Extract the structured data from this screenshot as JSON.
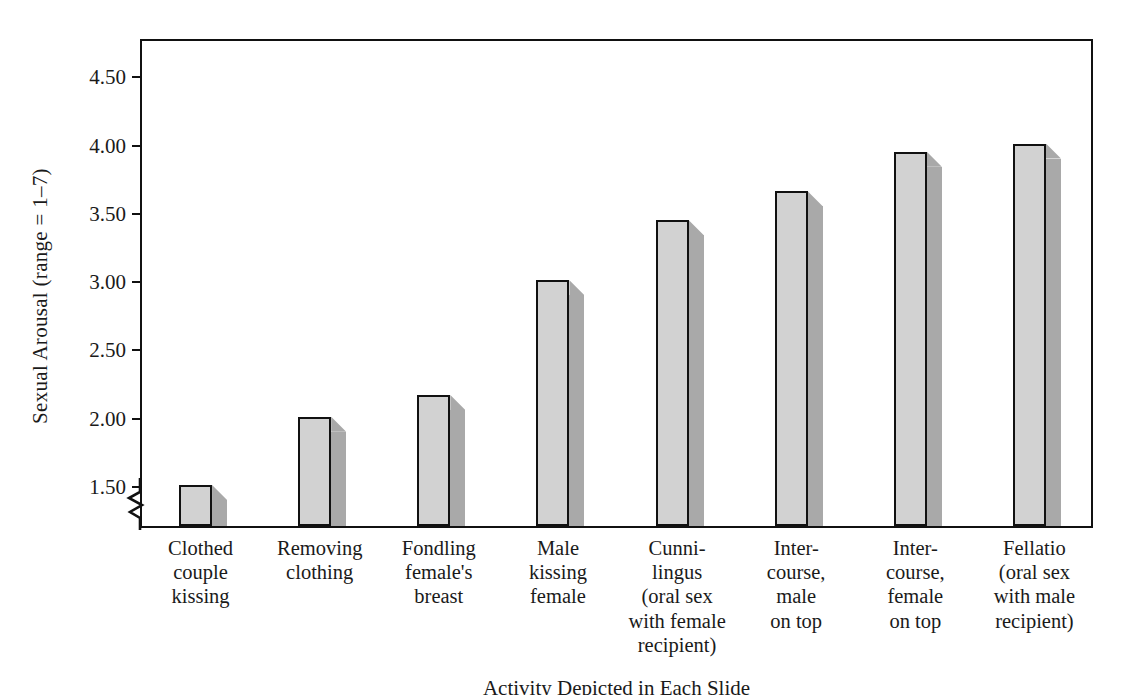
{
  "chart_data": {
    "type": "bar",
    "title": "",
    "subtitle": "",
    "xlabel": "Activity Depicted in Each Slide",
    "ylabel": "Sexual Arousal (range = 1–7)",
    "ylim": [
      1.2,
      4.78
    ],
    "yticks": [
      1.5,
      2.0,
      2.5,
      3.0,
      3.5,
      4.0,
      4.5
    ],
    "ytick_labels": [
      "1.50",
      "2.00",
      "2.50",
      "3.00",
      "3.50",
      "4.00",
      "4.50"
    ],
    "axis_break": true,
    "grid": false,
    "legend": null,
    "legend_position": "none",
    "categories": [
      "Clothed\ncouple\nkissing",
      "Removing\nclothing",
      "Fondling\nfemale's\nbreast",
      "Male\nkissing\nfemale",
      "Cunni-\nlingus\n(oral sex\nwith female\nrecipient)",
      "Inter-\ncourse,\nmale\non top",
      "Inter-\ncourse,\nfemale\non top",
      "Fellatio\n(oral sex\nwith male\nrecipient)"
    ],
    "values": [
      1.5,
      2.0,
      2.16,
      3.0,
      3.44,
      3.65,
      3.94,
      4.0
    ],
    "colors": {
      "bar_face": "#d2d2d2",
      "bar_side": "#a9a9a9",
      "bar_outline": "#111111",
      "axis": "#111111",
      "background": "#ffffff",
      "text": "#1a1a1a"
    }
  },
  "figure": {
    "y_axis_title": "Sexual Arousal (range = 1–7)",
    "x_axis_title": "Activity Depicted in Each Slide"
  }
}
